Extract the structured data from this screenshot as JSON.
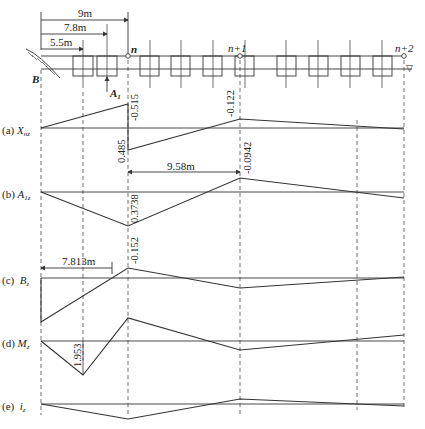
{
  "diagram": {
    "type": "influence-line-diagram",
    "dimensions": {
      "d9": "9m",
      "d78": "7.8m",
      "d55": "5.5m",
      "d958": "9.58m",
      "d7813": "7.813m"
    },
    "nodes": {
      "n": "n",
      "n1": "n+1",
      "n2": "n+2",
      "B": "B",
      "A1": "A",
      "A1_sub": "1"
    },
    "rows": [
      {
        "tag": "(a)",
        "symbol": "X",
        "sub": "nz",
        "values": {
          "peak_neg": "-0.515",
          "peak_pos": "0.485",
          "right": "-0.122"
        }
      },
      {
        "tag": "(b)",
        "symbol": "A",
        "sub": "1z",
        "values": {
          "min": "0.3738",
          "max": "-0.0942"
        }
      },
      {
        "tag": "(c)",
        "symbol": "B",
        "sub": "z",
        "values": {
          "peak": "-0.152"
        }
      },
      {
        "tag": "(d)",
        "symbol": "M",
        "sub": "z",
        "values": {
          "min": "1.953"
        }
      },
      {
        "tag": "(e)",
        "symbol": "i",
        "sub": "z",
        "values": {}
      }
    ],
    "water_symbol": "▽"
  }
}
